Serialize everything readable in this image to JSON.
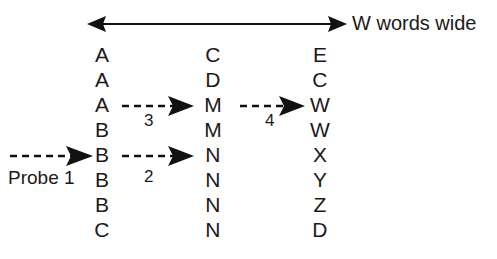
{
  "diagram": {
    "title_label": "W words wide",
    "probe_label": "Probe 1",
    "columns": [
      {
        "name": "left-column",
        "cells": [
          "A",
          "A",
          "A",
          "B",
          "B",
          "B",
          "B",
          "C"
        ]
      },
      {
        "name": "middle-column",
        "cells": [
          "C",
          "D",
          "M",
          "M",
          "N",
          "N",
          "N",
          "N"
        ]
      },
      {
        "name": "right-column",
        "cells": [
          "E",
          "C",
          "W",
          "W",
          "X",
          "Y",
          "Z",
          "D"
        ]
      }
    ],
    "steps": [
      {
        "name": "step-2",
        "label": "2"
      },
      {
        "name": "step-3",
        "label": "3"
      },
      {
        "name": "step-4",
        "label": "4"
      }
    ],
    "colors": {
      "ink": "#111111",
      "background": "#ffffff"
    }
  }
}
